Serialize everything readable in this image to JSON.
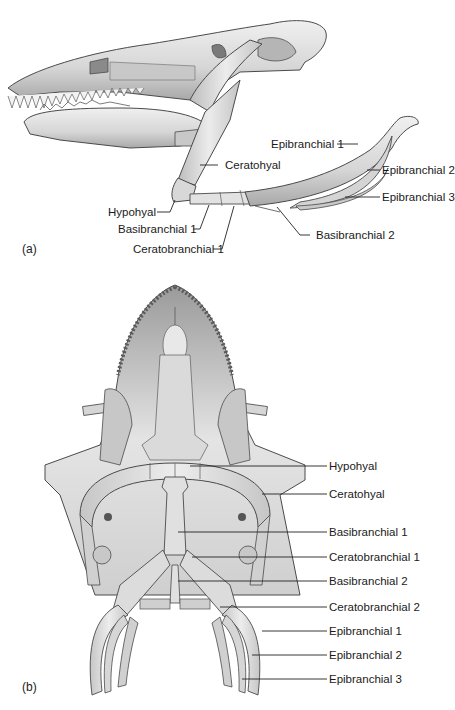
{
  "figure": {
    "panel_a": {
      "letter": "(a)",
      "view": "lateral",
      "labels": {
        "epibranchial_1": "Epibranchial 1",
        "epibranchial_2": "Epibranchial 2",
        "epibranchial_3": "Epibranchial 3",
        "ceratohyal": "Ceratohyal",
        "hypohyal": "Hypohyal",
        "basibranchial_1": "Basibranchial 1",
        "basibranchial_2": "Basibranchial 2",
        "ceratobranchial_1": "Ceratobranchial 1"
      }
    },
    "panel_b": {
      "letter": "(b)",
      "view": "ventral",
      "labels": [
        "Hypohyal",
        "Ceratohyal",
        "Basibranchial 1",
        "Ceratobranchial 1",
        "Basibranchial 2",
        "Ceratobranchial 2",
        "Epibranchial 1",
        "Epibranchial 2",
        "Epibranchial 3"
      ]
    },
    "colors": {
      "bone": "#dcdcdc",
      "bone_shadow": "#a9a9a9",
      "outline": "#4a4a4a",
      "leader": "#222222",
      "background": "#ffffff"
    }
  }
}
